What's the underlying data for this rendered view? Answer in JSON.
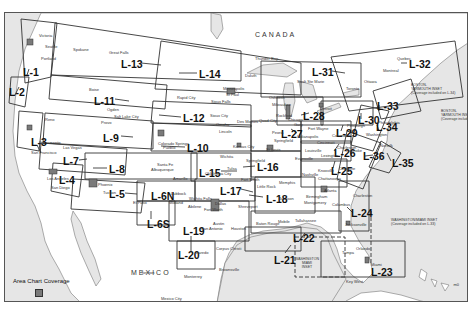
{
  "map": {
    "countries": {
      "canada": "CANADA",
      "mexico": "MEXICO"
    },
    "colors": {
      "water": "#e6e6e6",
      "land": "#ffffff",
      "area_chart": "#7a7a7a",
      "lines": "#333333"
    },
    "charts": [
      {
        "id": "L-1",
        "label": "L-1",
        "x": 22,
        "y": 66
      },
      {
        "id": "L-2",
        "label": "L-2",
        "x": 8,
        "y": 86
      },
      {
        "id": "L-3",
        "label": "L-3",
        "x": 30,
        "y": 136
      },
      {
        "id": "L-4",
        "label": "L-4",
        "x": 58,
        "y": 174
      },
      {
        "id": "L-5",
        "label": "L-5",
        "x": 108,
        "y": 188
      },
      {
        "id": "L-6N",
        "label": "L-6N",
        "x": 150,
        "y": 190
      },
      {
        "id": "L-6S",
        "label": "L-6S",
        "x": 146,
        "y": 218
      },
      {
        "id": "L-7",
        "label": "L-7",
        "x": 62,
        "y": 155
      },
      {
        "id": "L-8",
        "label": "L-8",
        "x": 108,
        "y": 163
      },
      {
        "id": "L-9",
        "label": "L-9",
        "x": 102,
        "y": 132
      },
      {
        "id": "L-10",
        "label": "L-10",
        "x": 186,
        "y": 142
      },
      {
        "id": "L-11",
        "label": "L-11",
        "x": 93,
        "y": 95
      },
      {
        "id": "L-12",
        "label": "L-12",
        "x": 182,
        "y": 112
      },
      {
        "id": "L-13",
        "label": "L-13",
        "x": 120,
        "y": 58
      },
      {
        "id": "L-14",
        "label": "L-14",
        "x": 198,
        "y": 68
      },
      {
        "id": "L-15",
        "label": "L-15",
        "x": 198,
        "y": 167
      },
      {
        "id": "L-16",
        "label": "L-16",
        "x": 256,
        "y": 161
      },
      {
        "id": "L-17",
        "label": "L-17",
        "x": 219,
        "y": 185
      },
      {
        "id": "L-18",
        "label": "L-18",
        "x": 265,
        "y": 193
      },
      {
        "id": "L-19",
        "label": "L-19",
        "x": 182,
        "y": 225
      },
      {
        "id": "L-20",
        "label": "L-20",
        "x": 177,
        "y": 249
      },
      {
        "id": "L-21",
        "label": "L-21",
        "x": 273,
        "y": 254
      },
      {
        "id": "L-22",
        "label": "L-22",
        "x": 292,
        "y": 232
      },
      {
        "id": "L-23",
        "label": "L-23",
        "x": 370,
        "y": 266
      },
      {
        "id": "L-24",
        "label": "L-24",
        "x": 350,
        "y": 207
      },
      {
        "id": "L-25",
        "label": "L-25",
        "x": 330,
        "y": 165
      },
      {
        "id": "L-26",
        "label": "L-26",
        "x": 333,
        "y": 147
      },
      {
        "id": "L-27",
        "label": "L-27",
        "x": 280,
        "y": 128
      },
      {
        "id": "L-28",
        "label": "L-28",
        "x": 302,
        "y": 110
      },
      {
        "id": "L-29",
        "label": "L-29",
        "x": 335,
        "y": 127
      },
      {
        "id": "L-30",
        "label": "L-30",
        "x": 357,
        "y": 114
      },
      {
        "id": "L-31",
        "label": "L-31",
        "x": 311,
        "y": 66
      },
      {
        "id": "L-32",
        "label": "L-32",
        "x": 408,
        "y": 58
      },
      {
        "id": "L-33",
        "label": "L-33",
        "x": 376,
        "y": 100
      },
      {
        "id": "L-34",
        "label": "L-34",
        "x": 375,
        "y": 121
      },
      {
        "id": "L-35",
        "label": "L-35",
        "x": 391,
        "y": 157
      },
      {
        "id": "L-36",
        "label": "L-36",
        "x": 362,
        "y": 150
      }
    ],
    "cities": [
      {
        "name": "Spokane",
        "x": 72,
        "y": 47
      },
      {
        "name": "Great Falls",
        "x": 108,
        "y": 50
      },
      {
        "name": "Boise",
        "x": 88,
        "y": 87
      },
      {
        "name": "Ogden",
        "x": 106,
        "y": 107
      },
      {
        "name": "Salt Lake City",
        "x": 113,
        "y": 114
      },
      {
        "name": "Provo",
        "x": 100,
        "y": 120
      },
      {
        "name": "Reno",
        "x": 44,
        "y": 117
      },
      {
        "name": "Las Vegas",
        "x": 62,
        "y": 145
      },
      {
        "name": "Santa Fe",
        "x": 156,
        "y": 162
      },
      {
        "name": "Albuquerque",
        "x": 150,
        "y": 167
      },
      {
        "name": "Phoenix",
        "x": 97,
        "y": 182
      },
      {
        "name": "Tucson",
        "x": 102,
        "y": 190
      },
      {
        "name": "El Paso",
        "x": 132,
        "y": 200
      },
      {
        "name": "Colorado Springs",
        "x": 157,
        "y": 141
      },
      {
        "name": "Pueblo",
        "x": 162,
        "y": 145
      },
      {
        "name": "Rapid City",
        "x": 176,
        "y": 95
      },
      {
        "name": "Sioux Falls",
        "x": 210,
        "y": 99
      },
      {
        "name": "Sioux City",
        "x": 209,
        "y": 113
      },
      {
        "name": "Omaha",
        "x": 215,
        "y": 122
      },
      {
        "name": "Des Moines",
        "x": 236,
        "y": 119
      },
      {
        "name": "Lincoln",
        "x": 218,
        "y": 129
      },
      {
        "name": "Kansas City",
        "x": 232,
        "y": 144
      },
      {
        "name": "Wichita",
        "x": 219,
        "y": 154
      },
      {
        "name": "Springfield",
        "x": 245,
        "y": 158
      },
      {
        "name": "Tulsa",
        "x": 226,
        "y": 166
      },
      {
        "name": "Oklahoma City",
        "x": 204,
        "y": 171
      },
      {
        "name": "Amarillo",
        "x": 172,
        "y": 176
      },
      {
        "name": "Lubbock",
        "x": 170,
        "y": 191
      },
      {
        "name": "Wichita Falls",
        "x": 188,
        "y": 196
      },
      {
        "name": "Abilene",
        "x": 187,
        "y": 204
      },
      {
        "name": "Midland",
        "x": 168,
        "y": 200
      },
      {
        "name": "Fort Worth",
        "x": 203,
        "y": 207
      },
      {
        "name": "Dallas",
        "x": 214,
        "y": 201
      },
      {
        "name": "Shreveport",
        "x": 237,
        "y": 204
      },
      {
        "name": "Fort Smith",
        "x": 240,
        "y": 177
      },
      {
        "name": "Little Rock",
        "x": 256,
        "y": 184
      },
      {
        "name": "Memphis",
        "x": 278,
        "y": 180
      },
      {
        "name": "Jackson",
        "x": 278,
        "y": 196
      },
      {
        "name": "Austin",
        "x": 212,
        "y": 221
      },
      {
        "name": "San Antonio",
        "x": 200,
        "y": 226
      },
      {
        "name": "Houston",
        "x": 230,
        "y": 226
      },
      {
        "name": "Corpus Christi",
        "x": 215,
        "y": 246
      },
      {
        "name": "Brownsville",
        "x": 218,
        "y": 267
      },
      {
        "name": "Laredo",
        "x": 195,
        "y": 250
      },
      {
        "name": "Monterrey",
        "x": 183,
        "y": 274
      },
      {
        "name": "Baton Rouge",
        "x": 255,
        "y": 221
      },
      {
        "name": "Mobile",
        "x": 277,
        "y": 219
      },
      {
        "name": "Tallahassee",
        "x": 294,
        "y": 218
      },
      {
        "name": "Atlanta",
        "x": 323,
        "y": 188
      },
      {
        "name": "Birmingham",
        "x": 305,
        "y": 194
      },
      {
        "name": "Columbus",
        "x": 331,
        "y": 202
      },
      {
        "name": "Montgomery",
        "x": 303,
        "y": 200
      },
      {
        "name": "Nashville",
        "x": 301,
        "y": 172
      },
      {
        "name": "Knoxville",
        "x": 317,
        "y": 168
      },
      {
        "name": "Chattanooga",
        "x": 317,
        "y": 176
      },
      {
        "name": "Charleston",
        "x": 352,
        "y": 193
      },
      {
        "name": "Jacksonville",
        "x": 344,
        "y": 222
      },
      {
        "name": "Orlando",
        "x": 355,
        "y": 246
      },
      {
        "name": "Tampa",
        "x": 341,
        "y": 250
      },
      {
        "name": "Miami",
        "x": 370,
        "y": 262
      },
      {
        "name": "Key West",
        "x": 345,
        "y": 279
      },
      {
        "name": "Louisville",
        "x": 304,
        "y": 148
      },
      {
        "name": "Evansville",
        "x": 294,
        "y": 156
      },
      {
        "name": "Lexington",
        "x": 320,
        "y": 153
      },
      {
        "name": "Cincinnati",
        "x": 316,
        "y": 140
      },
      {
        "name": "Indianapolis",
        "x": 296,
        "y": 134
      },
      {
        "name": "Columbus",
        "x": 331,
        "y": 133
      },
      {
        "name": "Pittsburgh",
        "x": 346,
        "y": 123
      },
      {
        "name": "Fort Wayne",
        "x": 307,
        "y": 126
      },
      {
        "name": "St Louis",
        "x": 265,
        "y": 147
      },
      {
        "name": "Springfield",
        "x": 273,
        "y": 138
      },
      {
        "name": "Peoria",
        "x": 271,
        "y": 130
      },
      {
        "name": "Rockford",
        "x": 275,
        "y": 113
      },
      {
        "name": "Chicago",
        "x": 287,
        "y": 117
      },
      {
        "name": "Gary",
        "x": 293,
        "y": 122
      },
      {
        "name": "Quad City",
        "x": 258,
        "y": 118
      },
      {
        "name": "Oshkosh",
        "x": 268,
        "y": 95
      },
      {
        "name": "Milwaukee",
        "x": 271,
        "y": 102
      },
      {
        "name": "Minneapolis",
        "x": 222,
        "y": 86
      },
      {
        "name": "St Paul",
        "x": 225,
        "y": 92
      },
      {
        "name": "Duluth",
        "x": 244,
        "y": 73
      },
      {
        "name": "Thunder Bay",
        "x": 254,
        "y": 56
      },
      {
        "name": "Sault Ste Marie",
        "x": 296,
        "y": 79
      },
      {
        "name": "Detroit",
        "x": 319,
        "y": 106
      },
      {
        "name": "Toronto",
        "x": 345,
        "y": 86
      },
      {
        "name": "Montreal",
        "x": 382,
        "y": 68
      },
      {
        "name": "Ottawa",
        "x": 363,
        "y": 79
      },
      {
        "name": "Quebec",
        "x": 396,
        "y": 56
      },
      {
        "name": "Philadelphia",
        "x": 377,
        "y": 120
      },
      {
        "name": "Washington",
        "x": 365,
        "y": 132
      },
      {
        "name": "Norfolk",
        "x": 379,
        "y": 143
      },
      {
        "name": "Charlotte",
        "x": 338,
        "y": 166
      },
      {
        "name": "Roanoke",
        "x": 345,
        "y": 148
      },
      {
        "name": "Charleston",
        "x": 336,
        "y": 145
      },
      {
        "name": "Victoria",
        "x": 38,
        "y": 33
      },
      {
        "name": "Seattle",
        "x": 44,
        "y": 44
      },
      {
        "name": "Portland",
        "x": 40,
        "y": 56
      },
      {
        "name": "Sacramento",
        "x": 38,
        "y": 140
      },
      {
        "name": "San Francisco",
        "x": 30,
        "y": 150
      },
      {
        "name": "Los Angeles",
        "x": 46,
        "y": 176
      },
      {
        "name": "San Diego",
        "x": 50,
        "y": 185
      },
      {
        "name": "Torreon",
        "x": 140,
        "y": 270
      },
      {
        "name": "Mexico City",
        "x": 160,
        "y": 296
      }
    ],
    "notes": {
      "boston_inset_top": "BOSTON-\nYARMOUTH INSET\n(Coverage included on L-34)",
      "boston_inset_arrow": "BOSTON-\nYARMOUTH INSET\n(Coverage included on L-34)",
      "washington_inset": "WASHINGTON/MIAMI INSET\n(Coverage included on L-33)",
      "washington_miami_inset": "WASHINGTON\nMIAMI\nINSET"
    },
    "legend": {
      "label": "Area Chart Coverage"
    },
    "page_number": "m0"
  }
}
